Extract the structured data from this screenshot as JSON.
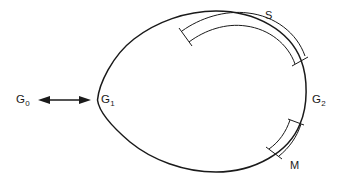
{
  "figure": {
    "type": "line-diagram",
    "background_color": "#ffffff",
    "stroke_color": "#1a1a1a",
    "canvas": {
      "width": 340,
      "height": 185
    },
    "labels": {
      "g0": {
        "base": "G",
        "sub": "0"
      },
      "g1": {
        "base": "G",
        "sub": "1"
      },
      "g2": {
        "base": "G",
        "sub": "2"
      },
      "s": "S",
      "m": "M"
    },
    "elements": {
      "outline_name": "teardrop-outline",
      "arrow_name": "g0-g1-double-arrow",
      "band_upper_name": "arc-band-s",
      "band_lower_name": "arc-band-m"
    }
  }
}
